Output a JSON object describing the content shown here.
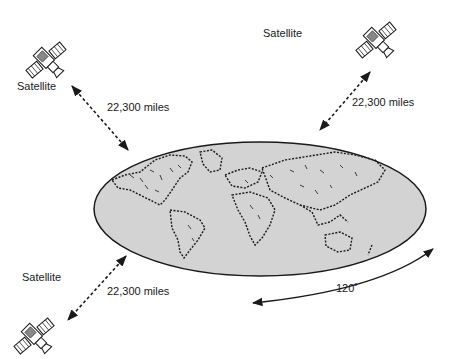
{
  "diagram": {
    "type": "geostationary-satellite-coverage",
    "earth": {
      "label": "",
      "fill": "#d3d3d3",
      "stroke": "#1a1a1a"
    },
    "satellites": [
      {
        "id": "top-left",
        "label": "Satellite",
        "distance_label": "22,300 miles"
      },
      {
        "id": "top-right",
        "label": "Satellite",
        "distance_label": "22,300 miles"
      },
      {
        "id": "bottom-left",
        "label": "Satellite",
        "distance_label": "22,300 miles"
      }
    ],
    "angle_label": "120˚",
    "colors": {
      "ink": "#1a1a1a",
      "earth_fill": "#d3d3d3",
      "background": "#ffffff"
    }
  }
}
